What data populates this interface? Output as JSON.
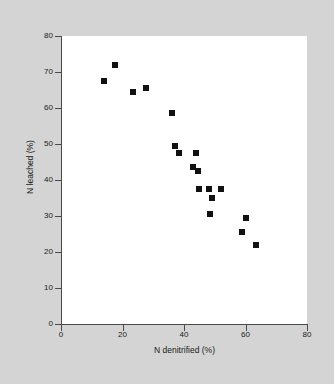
{
  "figure": {
    "background_color": "#d4d4d4",
    "plot_background_color": "#ffffff",
    "axis_color": "#4a4a4a",
    "marker_color": "#111111"
  },
  "chart_data": {
    "type": "scatter",
    "title": "",
    "xlabel": "N denitrified (%)",
    "ylabel": "N leached (%)",
    "xlim": [
      0,
      80
    ],
    "ylim": [
      0,
      80
    ],
    "xticks": [
      0,
      20,
      40,
      60,
      80
    ],
    "yticks": [
      0,
      10,
      20,
      30,
      40,
      50,
      60,
      70,
      80
    ],
    "xtick_labels": [
      "0",
      "20",
      "40",
      "60",
      "80"
    ],
    "ytick_labels": [
      "0",
      "10",
      "20",
      "30",
      "40",
      "50",
      "60",
      "70",
      "80"
    ],
    "grid": false,
    "legend": null,
    "marker": "square",
    "marker_size_px": 6,
    "n_points": 21,
    "points": [
      {
        "x": 17.5,
        "y": 72.0
      },
      {
        "x": 14.0,
        "y": 67.5
      },
      {
        "x": 23.5,
        "y": 64.5
      },
      {
        "x": 27.5,
        "y": 65.5
      },
      {
        "x": 36.0,
        "y": 58.5
      },
      {
        "x": 37.0,
        "y": 49.5
      },
      {
        "x": 38.5,
        "y": 47.5
      },
      {
        "x": 44.0,
        "y": 47.5
      },
      {
        "x": 43.0,
        "y": 43.5
      },
      {
        "x": 44.5,
        "y": 42.5
      },
      {
        "x": 45.0,
        "y": 37.5
      },
      {
        "x": 48.0,
        "y": 37.5
      },
      {
        "x": 52.0,
        "y": 37.5
      },
      {
        "x": 49.0,
        "y": 35.0
      },
      {
        "x": 48.5,
        "y": 30.5
      },
      {
        "x": 60.0,
        "y": 29.5
      },
      {
        "x": 59.0,
        "y": 25.5
      },
      {
        "x": 63.5,
        "y": 22.0
      },
      {
        "x": 36.0,
        "y": 58.5
      },
      {
        "x": 43.0,
        "y": 43.5
      },
      {
        "x": 44.5,
        "y": 42.5
      }
    ]
  }
}
